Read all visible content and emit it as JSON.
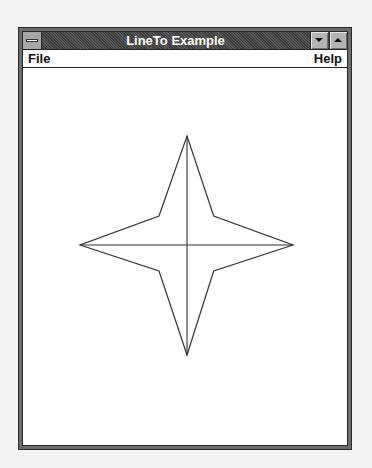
{
  "window": {
    "title": "LineTo Example",
    "system_menu_icon": "system-menu-icon",
    "minimize_icon": "minimize-arrow-icon",
    "maximize_icon": "maximize-arrow-icon"
  },
  "menubar": {
    "items": [
      {
        "label": "File"
      },
      {
        "label": "Help"
      }
    ]
  },
  "drawing": {
    "shape": "four-point-star",
    "stroke_color": "#333333",
    "outline_points": [
      [
        164.0,
        68.0
      ],
      [
        190.7,
        148.0
      ],
      [
        270.0,
        177.0
      ],
      [
        190.7,
        203.0
      ],
      [
        164.0,
        287.0
      ],
      [
        136.0,
        203.0
      ],
      [
        57.0,
        177.0
      ],
      [
        136.0,
        148.0
      ]
    ],
    "cross_lines": [
      [
        [
          164.0,
          68.0
        ],
        [
          164.0,
          287.0
        ]
      ],
      [
        [
          57.0,
          177.0
        ],
        [
          270.0,
          177.0
        ]
      ]
    ]
  }
}
